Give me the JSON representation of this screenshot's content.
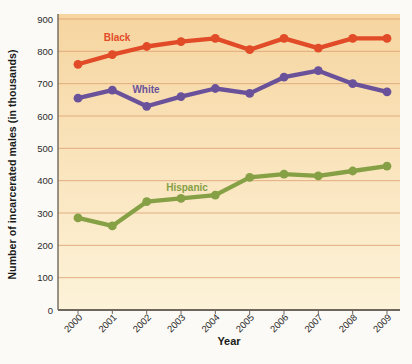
{
  "chart_data": {
    "type": "line",
    "title": "",
    "xlabel": "Year",
    "ylabel": "Number of incarcerated males (in thousands)",
    "x": [
      "2000",
      "2001",
      "2002",
      "2003",
      "2004",
      "2005",
      "2006",
      "2007",
      "2008",
      "2009"
    ],
    "ylim": [
      0,
      900
    ],
    "yticks": [
      0,
      100,
      200,
      300,
      400,
      500,
      600,
      700,
      800,
      900
    ],
    "grid": true,
    "legend_position": "inline series labels next to each line",
    "series": [
      {
        "name": "Black",
        "color": "#e14b28",
        "values": [
          760,
          790,
          815,
          830,
          840,
          805,
          840,
          810,
          840,
          840
        ],
        "label": {
          "text": "Black",
          "x": 117,
          "y": 41
        }
      },
      {
        "name": "White",
        "color": "#6a529b",
        "values": [
          655,
          680,
          630,
          660,
          685,
          670,
          720,
          740,
          700,
          675
        ],
        "label": {
          "text": "White",
          "x": 146,
          "y": 93
        }
      },
      {
        "name": "Hispanic",
        "color": "#86a045",
        "values": [
          285,
          260,
          335,
          345,
          355,
          410,
          420,
          415,
          430,
          445
        ],
        "label": {
          "text": "Hispanic",
          "x": 187,
          "y": 191
        }
      }
    ],
    "style": {
      "page_bg": "#fbfaf6",
      "plot_bg_top": "#f6d5a0",
      "plot_bg_bottom": "#fdf3d9",
      "gridline_color": "#dfa377",
      "axis_color": "#6f675c",
      "tick_label_color": "#2b2b2b"
    }
  }
}
